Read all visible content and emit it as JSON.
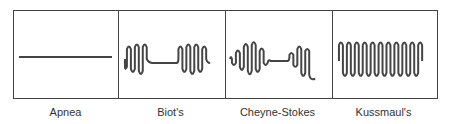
{
  "diagram": {
    "stroke_color": "#444444",
    "panels": [
      {
        "id": "apnea",
        "label": "Apnea",
        "pattern": "flat line"
      },
      {
        "id": "biots",
        "label": "Biot's",
        "pattern": "burst of waves, flat pause, burst of waves"
      },
      {
        "id": "cheyne-stokes",
        "label": "Cheyne-Stokes",
        "pattern": "waxing-waning waves, flat pause, waves"
      },
      {
        "id": "kussmauls",
        "label": "Kussmaul's",
        "pattern": "continuous deep regular waves"
      }
    ]
  }
}
